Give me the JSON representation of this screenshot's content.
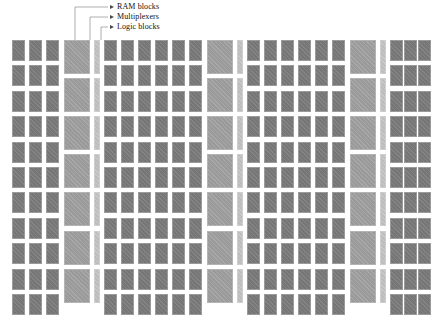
{
  "diagram": {
    "background_color": "#ffffff",
    "width": 424,
    "height": 320
  },
  "annotations": {
    "items": [
      {
        "id": "ram-blocks",
        "label": "RAM blocks",
        "label_x": 117,
        "label_y": 3,
        "marker_x": 110,
        "marker_y": 7,
        "leader": "M 75 7 L 110 7",
        "target_x": 75,
        "target_y": 40
      },
      {
        "id": "multiplexers",
        "label": "Multiplexers",
        "label_x": 117,
        "label_y": 13,
        "marker_x": 110,
        "marker_y": 17,
        "leader": "M 90 17 L 110 17",
        "target_x": 90,
        "target_y": 40
      },
      {
        "id": "logic-blocks",
        "label": "Logic blocks",
        "label_x": 117,
        "label_y": 23,
        "marker_x": 110,
        "marker_y": 27,
        "leader": "M 101 27 L 110 27",
        "target_x": 101,
        "target_y": 40
      }
    ],
    "leader_paths": [
      "M 75 40 L 75 7 L 108 7",
      "M 90 40 L 90 17 L 108 17",
      "M 101 40 L 101 27 L 108 27"
    ],
    "leader_color": "#9a9a9a",
    "marker_color": "#4a4a4a",
    "text_color": "#111111"
  },
  "colors": {
    "logic_block": "#767676",
    "ram_block": "#9a9a9a",
    "multiplexer": "#bdbdbd",
    "background": "#ffffff"
  },
  "legend_types": [
    "RAM blocks",
    "Multiplexers",
    "Logic blocks"
  ],
  "floorplan": {
    "rows": 11,
    "row_top": 40,
    "row_height": 25.4,
    "logic_width": 13,
    "logic_height": 21,
    "ram_width": 26,
    "mux_width": 6,
    "columns": [
      {
        "type": "logic",
        "x": 12,
        "count": 11
      },
      {
        "type": "logic",
        "x": 29,
        "count": 11
      },
      {
        "type": "logic",
        "x": 46,
        "count": 11
      },
      {
        "type": "ram",
        "x": 64,
        "count": 7
      },
      {
        "type": "mux",
        "x": 94,
        "count": 7
      },
      {
        "type": "logic",
        "x": 104,
        "count": 11
      },
      {
        "type": "logic",
        "x": 121,
        "count": 11
      },
      {
        "type": "logic",
        "x": 138,
        "count": 11
      },
      {
        "type": "logic",
        "x": 155,
        "count": 11
      },
      {
        "type": "logic",
        "x": 172,
        "count": 11
      },
      {
        "type": "logic",
        "x": 189,
        "count": 11
      },
      {
        "type": "ram",
        "x": 207,
        "count": 7
      },
      {
        "type": "mux",
        "x": 237,
        "count": 7
      },
      {
        "type": "logic",
        "x": 247,
        "count": 11
      },
      {
        "type": "logic",
        "x": 264,
        "count": 11
      },
      {
        "type": "logic",
        "x": 281,
        "count": 11
      },
      {
        "type": "logic",
        "x": 298,
        "count": 11
      },
      {
        "type": "logic",
        "x": 315,
        "count": 11
      },
      {
        "type": "logic",
        "x": 332,
        "count": 11
      },
      {
        "type": "ram",
        "x": 350,
        "count": 7
      },
      {
        "type": "mux",
        "x": 380,
        "count": 7
      },
      {
        "type": "logic",
        "x": 390,
        "count": 11
      },
      {
        "type": "logic",
        "x": 404,
        "count": 11
      },
      {
        "type": "logic",
        "x": 418,
        "count": 11
      }
    ]
  }
}
